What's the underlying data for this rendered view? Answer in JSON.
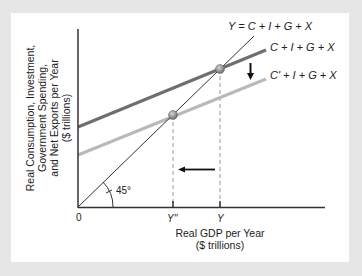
{
  "diagram": {
    "y_axis_label": {
      "lines": [
        "Real Consumption, Investment,",
        "Government Spending,",
        "and Net Exports per Year",
        "($ trillions)"
      ]
    },
    "x_axis_label": {
      "lines": [
        "Real GDP per Year",
        "($ trillions)"
      ]
    },
    "origin_label": "0",
    "angle_label": "45°",
    "x_ticks": [
      {
        "label": "Y''",
        "x": 173
      },
      {
        "label": "Y",
        "x": 220
      }
    ],
    "curves": [
      {
        "name": "45-degree-line",
        "label": "Y = C + I + G + X",
        "color": "#333333"
      },
      {
        "name": "aggregate-expenditure-original",
        "label": "C + I + G + X",
        "color": "#6e6e6e"
      },
      {
        "name": "aggregate-expenditure-reduced",
        "label": "C' + I + G + X",
        "color": "#b9b9b9"
      }
    ],
    "equilibria": [
      {
        "name": "original-equilibrium",
        "x": 220,
        "y": 69
      },
      {
        "name": "new-equilibrium",
        "x": 173,
        "y": 115
      }
    ],
    "arrows": [
      {
        "name": "downward-shift-arrow",
        "direction": "down"
      },
      {
        "name": "gdp-decrease-arrow",
        "direction": "left"
      }
    ],
    "colors": {
      "background": "#e6e6e6",
      "panel": "#ffffff",
      "axis": "#333333",
      "original_line": "#6e6e6e",
      "shifted_line": "#b9b9b9",
      "dashed": "#999999",
      "point": "#8a8a8a"
    }
  }
}
